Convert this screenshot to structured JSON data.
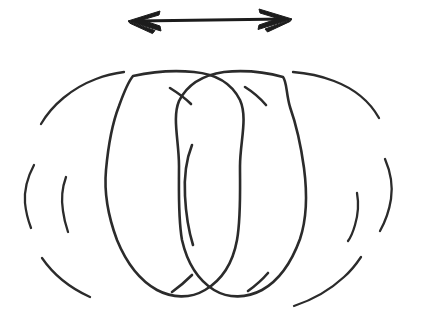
{
  "figure": {
    "title": "Oscillating sphere diagram",
    "description": "Hand-drawn sketch of two overlapping circles inside a dashed outer circle, with a horizontal double-headed arrow above.",
    "background_color": "#ffffff",
    "ink_color": "#2b2b2b",
    "arrow_color": "#1c1c1c",
    "canvas": {
      "width": 423,
      "height": 320
    },
    "elements": [
      {
        "name": "double-headed-arrow",
        "kind": "arrow",
        "label": "",
        "direction": "horizontal-bidirectional",
        "x_start": 128,
        "x_end": 292,
        "y": 20
      },
      {
        "name": "outer-dashed-circle",
        "kind": "circle-dashed",
        "label": "",
        "center_x": 208,
        "center_y": 192,
        "radius_x": 184,
        "radius_y": 122,
        "dash_count": 8
      },
      {
        "name": "left-solid-circle",
        "kind": "circle-solid",
        "label": "",
        "center_x": 172,
        "center_y": 192,
        "radius_x": 68,
        "radius_y": 104
      },
      {
        "name": "right-solid-circle",
        "kind": "circle-solid",
        "label": "",
        "center_x": 241,
        "center_y": 192,
        "radius_x": 66,
        "radius_y": 104
      },
      {
        "name": "inner-short-arc",
        "kind": "arc",
        "label": "",
        "center_x": 196,
        "center_y": 196,
        "radius_x": 12,
        "radius_y": 52
      }
    ],
    "crossings": [
      {
        "name": "top-left-crossing",
        "x": 170,
        "y": 88
      },
      {
        "name": "top-right-crossing",
        "x": 245,
        "y": 87
      },
      {
        "name": "bottom-left-crossing",
        "x": 172,
        "y": 292
      },
      {
        "name": "bottom-right-crossing",
        "x": 248,
        "y": 291
      }
    ]
  }
}
